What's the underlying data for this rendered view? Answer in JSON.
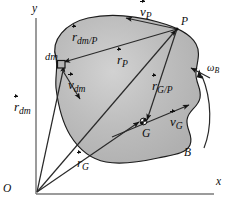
{
  "figure": {
    "type": "physics-diagram",
    "colors": {
      "body_fill": "#b9b9b9",
      "body_fill_highlight": "#cfcfcf",
      "body_outline": "#1a1a1a",
      "ink": "#0d0d0d",
      "axis": "#6e6e6e",
      "background": "#ffffff"
    },
    "axes": {
      "y_label": "y",
      "x_label": "x",
      "origin_label": "O"
    },
    "points": {
      "P": "P",
      "G": "G",
      "dm": "dm",
      "body": "B"
    },
    "vectors": [
      {
        "id": "v_P",
        "symbol": "v",
        "subscript": "P",
        "kind": "velocity",
        "note": "velocity of point P"
      },
      {
        "id": "v_G",
        "symbol": "v",
        "subscript": "G",
        "kind": "velocity",
        "note": "velocity of mass center G"
      },
      {
        "id": "v_dm",
        "symbol": "v",
        "subscript": "dm",
        "kind": "velocity",
        "note": "velocity of mass element dm"
      },
      {
        "id": "r_P",
        "symbol": "r",
        "subscript": "P",
        "kind": "position",
        "note": "position of P from O"
      },
      {
        "id": "r_G",
        "symbol": "r",
        "subscript": "G",
        "kind": "position",
        "note": "position of G from O"
      },
      {
        "id": "r_dm",
        "symbol": "r",
        "subscript": "dm",
        "kind": "position",
        "note": "position of dm from O"
      },
      {
        "id": "r_G/P",
        "symbol": "r",
        "subscript": "G/P",
        "kind": "relative-position",
        "note": "position of G relative to P"
      },
      {
        "id": "r_dm/P",
        "symbol": "r",
        "subscript": "dm/P",
        "kind": "relative-position",
        "note": "position of dm relative to P"
      }
    ],
    "angular_velocity": {
      "symbol": "ω",
      "subscript": "B",
      "note": "angular velocity of body B"
    },
    "labels": {
      "y": "y",
      "x": "x",
      "O": "O",
      "P": "P",
      "G": "G",
      "B": "B",
      "dm": "dm",
      "v_base": "v",
      "r_base": "r",
      "omega_base": "ω",
      "sub_P": "P",
      "sub_G": "G",
      "sub_dm": "dm",
      "sub_B": "B",
      "sub_G_over_P": "G/P",
      "sub_dm_over_P": "dm/P"
    }
  }
}
